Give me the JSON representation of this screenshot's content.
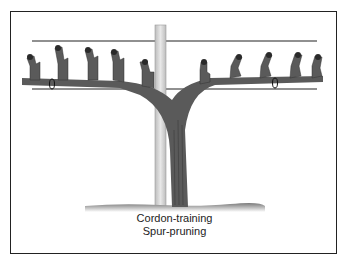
{
  "diagram": {
    "caption_line1": "Cordon-training",
    "caption_line2": "Spur-pruning",
    "elements": [
      "top-wire",
      "cordon-wire",
      "trellis-post",
      "vine-trunk",
      "left-cordon-arm",
      "right-cordon-arm",
      "spurs",
      "ties",
      "ground"
    ],
    "colors": {
      "vine": "#5a5a5a",
      "post": "#d4d4d4",
      "wire": "#222222",
      "frame": "#222222"
    }
  }
}
